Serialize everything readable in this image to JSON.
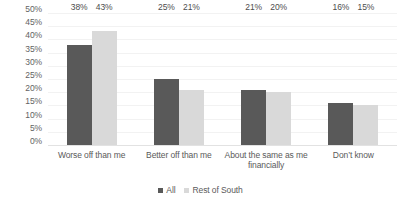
{
  "chart_data": {
    "type": "bar",
    "title": "",
    "subtitle": "",
    "xlabel": "",
    "ylabel": "",
    "ylim": [
      0,
      50
    ],
    "y_ticks": [
      "0%",
      "5%",
      "10%",
      "15%",
      "20%",
      "25%",
      "30%",
      "35%",
      "40%",
      "45%",
      "50%"
    ],
    "y_tick_values": [
      0,
      5,
      10,
      15,
      20,
      25,
      30,
      35,
      40,
      45,
      50
    ],
    "grid": true,
    "legend_position": "bottom",
    "categories": [
      "Worse off than me",
      "Better off than me",
      "About the same as me financially",
      "Don’t know"
    ],
    "series": [
      {
        "name": "All",
        "color": "#595959",
        "values": [
          38,
          25,
          21,
          16
        ],
        "labels": [
          "38%",
          "25%",
          "21%",
          "16%"
        ]
      },
      {
        "name": "Rest of South",
        "color": "#d9d9d9",
        "values": [
          43,
          21,
          20,
          15
        ],
        "labels": [
          "43%",
          "21%",
          "20%",
          "15%"
        ]
      }
    ]
  },
  "colors": {
    "series_all": "#595959",
    "series_rest_of_south": "#d9d9d9",
    "text": "#5a5a5a",
    "gridline": "#f2f2f2",
    "background": "#ffffff"
  }
}
